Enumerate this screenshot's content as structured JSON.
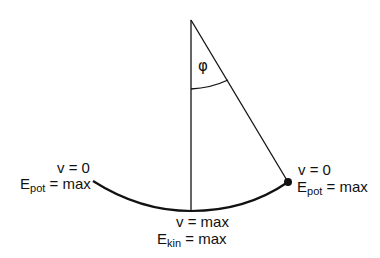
{
  "figure": {
    "type": "pendulum-energy-diagram",
    "angle_symbol": "φ",
    "left_extreme": {
      "velocity": "v = 0",
      "energy_symbol": "E",
      "energy_sub": "pot",
      "energy_value": " = max"
    },
    "right_extreme": {
      "velocity": "v = 0",
      "energy_symbol": "E",
      "energy_sub": "pot",
      "energy_value": " = max"
    },
    "bottom": {
      "velocity": "v = max",
      "energy_symbol": "E",
      "energy_sub": "kin",
      "energy_value": " = max"
    },
    "colors": {
      "line": "#111111",
      "background": "#ffffff"
    }
  }
}
